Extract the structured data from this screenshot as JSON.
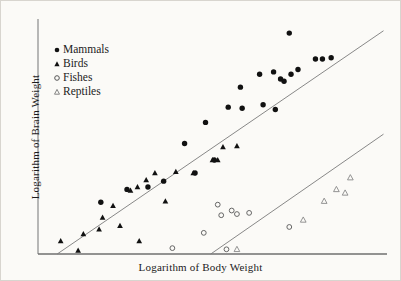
{
  "figure": {
    "background_color": "#fbfaf7",
    "ink_color": "#1b1b1b",
    "line_color": "#7a7a7a"
  },
  "legend": {
    "position": "top-left",
    "items": [
      {
        "label": "Mammals",
        "marker": "filled-circle-icon",
        "color": "#111111"
      },
      {
        "label": "Birds",
        "marker": "filled-triangle-icon",
        "color": "#111111"
      },
      {
        "label": "Fishes",
        "marker": "open-circle-icon",
        "color": "#555555"
      },
      {
        "label": "Reptiles",
        "marker": "open-triangle-icon",
        "color": "#777777"
      }
    ]
  },
  "chart_data": {
    "type": "scatter",
    "title": "",
    "xlabel": "Logarithm of Body Weight",
    "ylabel": "Logarithm of Brain Weight",
    "grid": false,
    "axis_ticks": false,
    "xlim": [
      0,
      100
    ],
    "ylim": [
      0,
      100
    ],
    "legend_position": "top-left",
    "series": [
      {
        "name": "Mammals",
        "marker": "filled-circle",
        "color": "#111111",
        "points": [
          [
            72.0,
            94.0
          ],
          [
            42.0,
            47.0
          ],
          [
            48.0,
            56.0
          ],
          [
            50.5,
            40.0
          ],
          [
            54.5,
            62.5
          ],
          [
            58.0,
            71.0
          ],
          [
            58.5,
            62.0
          ],
          [
            63.5,
            76.5
          ],
          [
            64.5,
            63.5
          ],
          [
            67.5,
            77.5
          ],
          [
            68.0,
            61.5
          ],
          [
            69.5,
            74.5
          ],
          [
            70.5,
            73.5
          ],
          [
            72.5,
            76.5
          ],
          [
            74.5,
            78.5
          ],
          [
            79.5,
            83.0
          ],
          [
            81.5,
            83.0
          ],
          [
            84.0,
            83.5
          ],
          [
            36.0,
            31.0
          ],
          [
            31.5,
            28.5
          ],
          [
            45.0,
            34.5
          ],
          [
            18.0,
            22.0
          ],
          [
            25.5,
            27.5
          ]
        ]
      },
      {
        "name": "Birds",
        "marker": "filled-triangle",
        "color": "#111111",
        "points": [
          [
            6.5,
            5.5
          ],
          [
            11.5,
            1.5
          ],
          [
            13.0,
            8.5
          ],
          [
            17.5,
            10.5
          ],
          [
            18.5,
            15.5
          ],
          [
            21.5,
            20.5
          ],
          [
            23.5,
            12.0
          ],
          [
            26.5,
            27.0
          ],
          [
            28.5,
            28.5
          ],
          [
            29.0,
            5.5
          ],
          [
            31.0,
            31.5
          ],
          [
            33.5,
            34.5
          ],
          [
            36.5,
            22.5
          ],
          [
            39.5,
            35.0
          ],
          [
            44.5,
            34.5
          ],
          [
            50.0,
            40.0
          ],
          [
            51.5,
            40.0
          ],
          [
            53.0,
            45.5
          ],
          [
            57.0,
            46.0
          ]
        ]
      },
      {
        "name": "Fishes",
        "marker": "open-circle",
        "color": "#666666",
        "points": [
          [
            38.5,
            2.5
          ],
          [
            47.5,
            9.0
          ],
          [
            51.5,
            21.0
          ],
          [
            52.5,
            16.5
          ],
          [
            55.5,
            18.5
          ],
          [
            57.0,
            17.0
          ],
          [
            54.0,
            2.0
          ],
          [
            60.5,
            17.5
          ],
          [
            72.0,
            11.5
          ]
        ]
      },
      {
        "name": "Reptiles",
        "marker": "open-triangle",
        "color": "#888888",
        "points": [
          [
            57.0,
            2.0
          ],
          [
            76.0,
            14.5
          ],
          [
            82.0,
            22.5
          ],
          [
            85.5,
            27.5
          ],
          [
            89.5,
            32.5
          ],
          [
            88.0,
            26.0
          ]
        ]
      }
    ],
    "trend_lines": [
      {
        "name": "upper-regression-line",
        "description": "Mammals and birds regression line",
        "from": [
          5.5,
          0.0
        ],
        "to": [
          99.0,
          95.0
        ],
        "color": "#7a7a7a"
      },
      {
        "name": "lower-regression-line",
        "description": "Fishes and reptiles regression line",
        "from": [
          49.5,
          0.0
        ],
        "to": [
          99.0,
          51.0
        ],
        "color": "#7a7a7a"
      }
    ]
  }
}
